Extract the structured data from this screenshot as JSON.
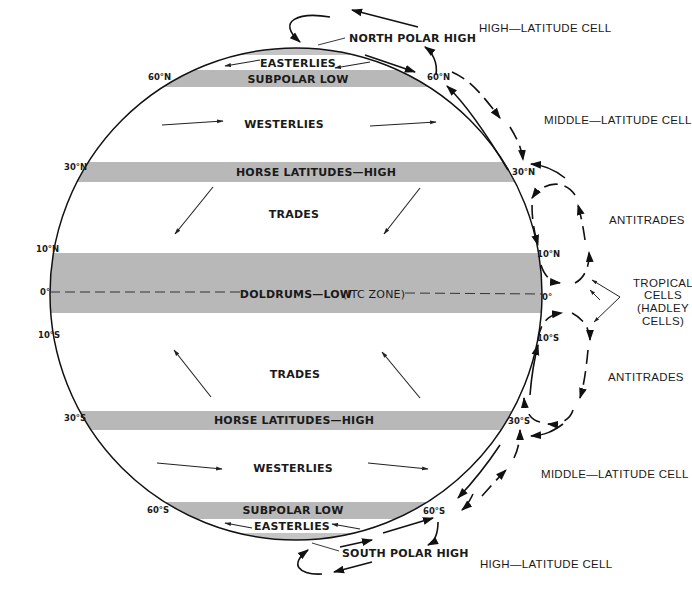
{
  "colors": {
    "band_gray": "#b8b8b8",
    "ink": "#1a1a1a",
    "background": "#ffffff"
  },
  "globe": {
    "bands": {
      "north_easterlies": "EASTERLIES",
      "north_subpolar_low": "SUBPOLAR LOW",
      "north_westerlies": "WESTERLIES",
      "north_horse_latitudes": "HORSE LATITUDES—HIGH",
      "north_trades": "TRADES",
      "doldrums": "DOLDRUMS—LOW",
      "itcz": "(ITC ZONE)",
      "south_trades": "TRADES",
      "south_horse_latitudes": "HORSE LATITUDES—HIGH",
      "south_westerlies": "WESTERLIES",
      "south_subpolar_low": "SUBPOLAR LOW",
      "south_easterlies": "EASTERLIES"
    },
    "poles": {
      "north": "NORTH POLAR HIGH",
      "south": "SOUTH POLAR HIGH"
    },
    "latitudes_left": {
      "n60": "60°N",
      "n30": "30°N",
      "n10": "10°N",
      "eq": "0°",
      "s10": "10°S",
      "s30": "30°S",
      "s60": "60°S"
    },
    "latitudes_right": {
      "n60": "60°N",
      "n30": "30°N",
      "n10": "10°N",
      "eq": "0°",
      "s10": "10°S",
      "s30": "30°S",
      "s60": "60°S"
    }
  },
  "cells": {
    "north_high_latitude": "HIGH—LATITUDE CELL",
    "north_middle_latitude": "MIDDLE—LATITUDE CELL",
    "north_antitrades": "ANTITRADES",
    "tropical_line1": "TROPICAL",
    "tropical_line2": "CELLS",
    "tropical_line3": "(HADLEY",
    "tropical_line4": "CELLS)",
    "south_antitrades": "ANTITRADES",
    "south_middle_latitude": "MIDDLE—LATITUDE CELL",
    "south_high_latitude": "HIGH—LATITUDE CELL"
  }
}
